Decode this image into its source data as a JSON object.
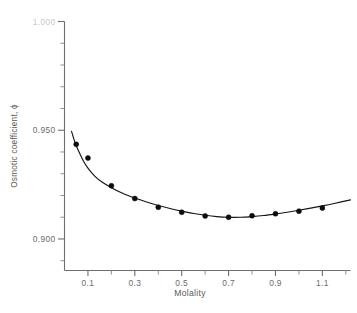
{
  "chart_data": {
    "type": "scatter",
    "title": "",
    "xlabel": "Molality",
    "ylabel": "Osmotic coefficient, ϕ",
    "xlim": [
      0.0,
      1.22
    ],
    "ylim": [
      0.8855,
      1.0
    ],
    "grid": false,
    "legend": null,
    "x_ticks_major": [
      0.1,
      0.3,
      0.5,
      0.7,
      0.9,
      1.1
    ],
    "x_ticklabels": [
      "0.1",
      "0.3",
      "0.5",
      "0.7",
      "0.9",
      "1.1"
    ],
    "x_ticks_minor": [
      0.2,
      0.4,
      0.6,
      0.8,
      1.0,
      1.2
    ],
    "y_ticks_major": [
      1.0,
      0.95,
      0.9
    ],
    "y_ticklabels": [
      "1.000",
      "0.950",
      "0.900"
    ],
    "y_ticks_minor": [
      0.99,
      0.98,
      0.97,
      0.96,
      0.94,
      0.93,
      0.92,
      0.91,
      0.89
    ],
    "series": [
      {
        "name": "Osmotic coefficient vs molality",
        "marker": "filled-circle",
        "marker_color": "#0d0d0d",
        "line_color": "#151515",
        "x": [
          0.05,
          0.1,
          0.2,
          0.3,
          0.4,
          0.5,
          0.6,
          0.7,
          0.8,
          0.9,
          1.0,
          1.1
        ],
        "y": [
          0.9435,
          0.9372,
          0.9245,
          0.9186,
          0.9146,
          0.9123,
          0.9106,
          0.91,
          0.9107,
          0.9116,
          0.9128,
          0.9142
        ]
      }
    ],
    "fit_curve": {
      "name": "smoothed fit",
      "x": [
        0.03,
        0.045,
        0.06,
        0.08,
        0.1,
        0.13,
        0.16,
        0.2,
        0.25,
        0.3,
        0.35,
        0.4,
        0.45,
        0.5,
        0.55,
        0.6,
        0.65,
        0.7,
        0.75,
        0.8,
        0.85,
        0.9,
        0.95,
        1.0,
        1.05,
        1.1,
        1.15,
        1.22
      ],
      "y": [
        0.9495,
        0.9443,
        0.9405,
        0.936,
        0.9326,
        0.9288,
        0.9262,
        0.9236,
        0.9209,
        0.9188,
        0.917,
        0.9154,
        0.914,
        0.9128,
        0.9117,
        0.9109,
        0.9103,
        0.91,
        0.91,
        0.9103,
        0.9108,
        0.9115,
        0.9123,
        0.9132,
        0.9142,
        0.9152,
        0.9163,
        0.918
      ]
    }
  },
  "axis_labels": {
    "x_title": "Molality",
    "y_title": "Osmotic coefficient, ϕ"
  },
  "tick_text": {
    "y": [
      "1.000",
      "0.950",
      "0.900"
    ],
    "x": [
      "0.1",
      "0.3",
      "0.5",
      "0.7",
      "0.9",
      "1.1"
    ]
  },
  "colors": {
    "axis": "#6e6e6e",
    "marker": "#0d0d0d",
    "curve": "#151515",
    "tick_label": "#6b6b6b",
    "background": "#ffffff"
  }
}
